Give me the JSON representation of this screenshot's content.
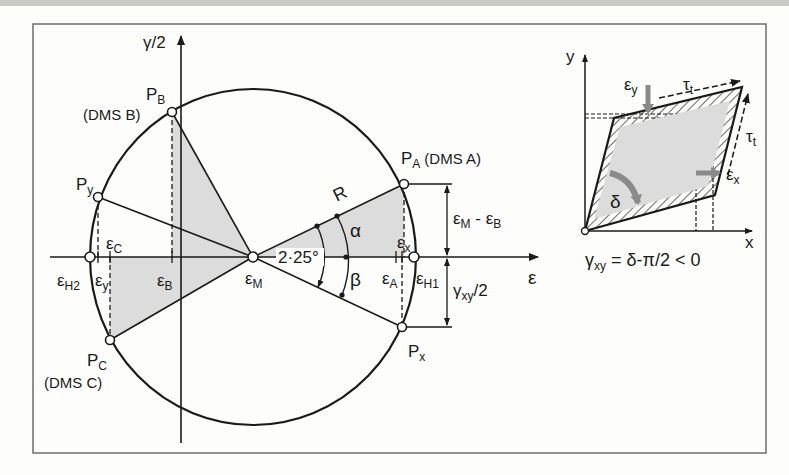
{
  "figure": {
    "type": "Mohr's strain circle with rosette strain gauges (DMS A, B, C) and element deformation sketch",
    "colors": {
      "line": "#1a1a1a",
      "shade": "#dcdcdc",
      "frame": "#6d6d6d",
      "arrow_gray": "#8a8a8a",
      "background": "#fdfdfc"
    }
  },
  "mohr": {
    "axis_vertical_label": "γ/2",
    "axis_horizontal_label": "ε",
    "points": {
      "PA": {
        "label": "P",
        "sub": "A",
        "note": "(DMS A)"
      },
      "PB": {
        "label": "P",
        "sub": "B",
        "note": "(DMS B)"
      },
      "PC": {
        "label": "P",
        "sub": "C",
        "note": "(DMS C)"
      },
      "Px": {
        "label": "P",
        "sub": "x"
      },
      "Py": {
        "label": "P",
        "sub": "y"
      }
    },
    "axis_labels": {
      "eH2": {
        "main": "ε",
        "sub": "H2"
      },
      "ey": {
        "main": "ε",
        "sub": "y"
      },
      "eC": {
        "main": "ε",
        "sub": "C"
      },
      "eB": {
        "main": "ε",
        "sub": "B"
      },
      "eM": {
        "main": "ε",
        "sub": "M"
      },
      "eA": {
        "main": "ε",
        "sub": "A"
      },
      "ex": {
        "main": "ε",
        "sub": "x"
      },
      "eH1": {
        "main": "ε",
        "sub": "H1"
      }
    },
    "angle_label": "2·25°",
    "radius_label": "R",
    "alpha_label": "α",
    "beta_label": "β",
    "dim_upper": {
      "a": "ε",
      "a_sub": "M",
      "dash": " - ",
      "b": "ε",
      "b_sub": "B"
    },
    "dim_lower": {
      "a": "γ",
      "a_sub": "xy",
      "rest": "/2"
    }
  },
  "element": {
    "x_axis": "x",
    "y_axis": "y",
    "tau_top": {
      "main": "τ",
      "sub": "t"
    },
    "tau_right": {
      "main": "τ",
      "sub": "t"
    },
    "eps_y": {
      "main": "ε",
      "sub": "y"
    },
    "eps_x": {
      "main": "ε",
      "sub": "x"
    },
    "delta": "δ",
    "formula": {
      "gamma": "γ",
      "sub": "xy",
      "rest": " = δ-π/2 < 0"
    }
  }
}
